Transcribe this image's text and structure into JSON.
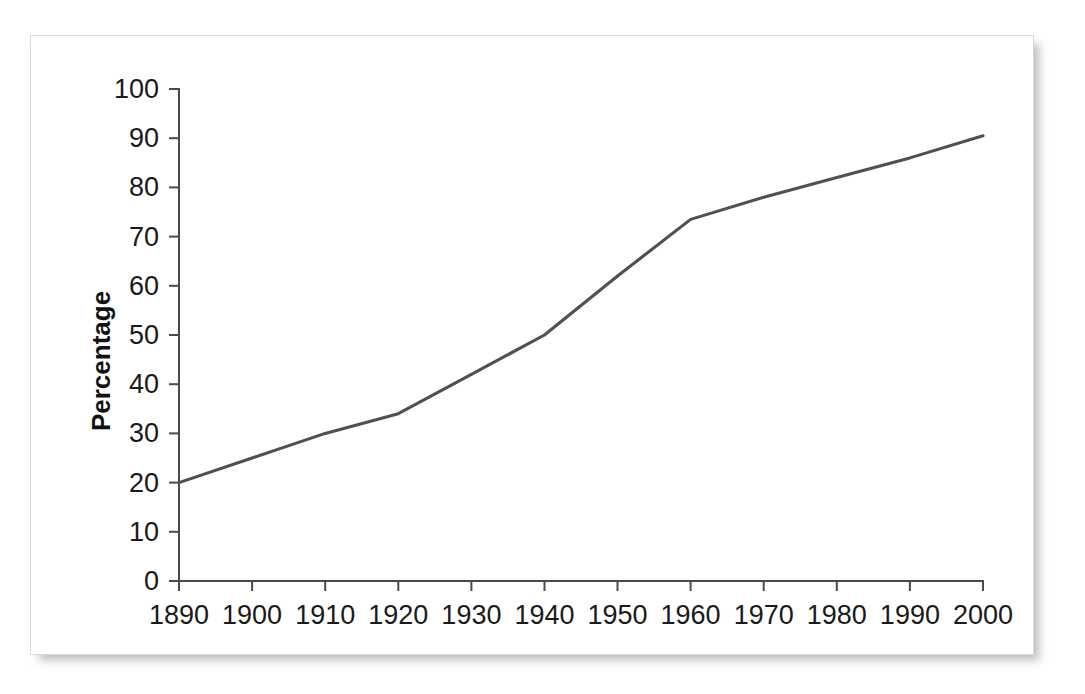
{
  "chart_data": {
    "type": "line",
    "title": "",
    "subtitle": "",
    "xlabel": "",
    "ylabel": "Percentage",
    "xlim": [
      1890,
      2000
    ],
    "ylim": [
      0,
      100
    ],
    "grid": false,
    "legend": false,
    "legend_position": "none",
    "markers": false,
    "x": [
      1890,
      1900,
      1910,
      1920,
      1930,
      1940,
      1950,
      1960,
      1970,
      1980,
      1990,
      2000
    ],
    "xtick_labels": [
      "1890",
      "1900",
      "1910",
      "1920",
      "1930",
      "1940",
      "1950",
      "1960",
      "1970",
      "1980",
      "1990",
      "2000"
    ],
    "ytick_values": [
      0,
      10,
      20,
      30,
      40,
      50,
      60,
      70,
      80,
      90,
      100
    ],
    "ytick_labels": [
      "0",
      "10",
      "20",
      "30",
      "40",
      "50",
      "60",
      "70",
      "80",
      "90",
      "100"
    ],
    "series": [
      {
        "name": "Percentage",
        "color": "#505050",
        "values": [
          20,
          25,
          30,
          34,
          42,
          50,
          62,
          73.5,
          78,
          82,
          86,
          90.5
        ]
      }
    ],
    "annotations": []
  },
  "style": {
    "line_color": "#505050",
    "axis_color": "#4a4a4a",
    "text_color": "#1a1a1a",
    "panel_background": "#ffffff",
    "panel_border": "#d8d8d8",
    "page_background": "#ffffff"
  }
}
